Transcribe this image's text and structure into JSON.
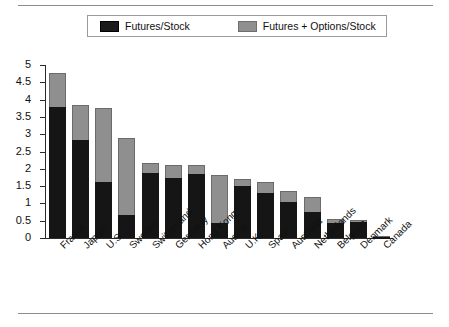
{
  "figure": {
    "rules": {
      "top": "horizontal-rule",
      "bottom": "horizontal-rule"
    }
  },
  "legend": {
    "position": "top-center",
    "entries": [
      {
        "label": "Futures/Stock",
        "color": "#151515",
        "swatch": "dark-swatch"
      },
      {
        "label": "Futures + Options/Stock",
        "color": "#8f8f8f",
        "swatch": "light-swatch"
      }
    ]
  },
  "chart_data": {
    "type": "bar",
    "stacked": true,
    "title": "",
    "subtitle": "",
    "xlabel": "",
    "ylabel": "",
    "ylim": [
      0,
      5
    ],
    "grid": false,
    "legend_position": "top-center",
    "yticks": [
      "0",
      "0.5",
      "1",
      "1.5",
      "2",
      "2.5",
      "3",
      "3.5",
      "4",
      "4.5",
      "5"
    ],
    "ytick_values": [
      0,
      0.5,
      1,
      1.5,
      2,
      2.5,
      3,
      3.5,
      4,
      4.5,
      5
    ],
    "categories": [
      "France",
      "Japan",
      "U.S.",
      "Sweden",
      "Switzerland",
      "Germany",
      "Hong Kong",
      "Austria",
      "U.K.",
      "Spain",
      "Australia",
      "Netherlands",
      "Belgium",
      "Denmark",
      "Canada"
    ],
    "series": [
      {
        "name": "Futures/Stock",
        "color": "#151515",
        "values": [
          3.78,
          2.83,
          1.62,
          0.67,
          1.88,
          1.73,
          1.86,
          0.44,
          1.5,
          1.3,
          1.03,
          0.76,
          0.44,
          0.47,
          0.05
        ]
      },
      {
        "name": "Futures + Options/Stock",
        "color": "#8f8f8f",
        "values": [
          4.77,
          3.83,
          3.77,
          2.88,
          2.17,
          2.12,
          2.11,
          1.82,
          1.71,
          1.63,
          1.35,
          1.19,
          0.55,
          0.53,
          0.06
        ]
      }
    ]
  }
}
